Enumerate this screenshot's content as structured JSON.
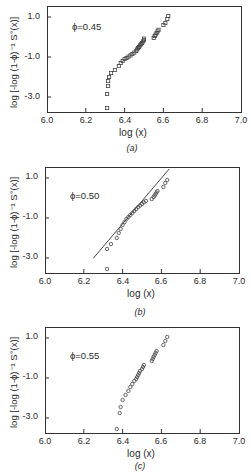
{
  "figure": {
    "panels": [
      {
        "id": "a",
        "phi_label": "ϕ=0.45",
        "caption": "(a)"
      },
      {
        "id": "b",
        "phi_label": "ϕ=0.50",
        "caption": "(b)"
      },
      {
        "id": "c",
        "phi_label": "ϕ=0.55",
        "caption": "(c)"
      }
    ],
    "ylabel": "log [-log (1-ϕ)⁻¹ S°(x)]",
    "xlabel": "log (x)",
    "xticks": [
      "6.0",
      "6.2",
      "6.4",
      "6.6",
      "6.8",
      "7.0"
    ],
    "yticks": [
      "1.0",
      "-1.0",
      "-3.0"
    ]
  },
  "chart_data": [
    {
      "type": "scatter",
      "title": "ϕ=0.45",
      "caption": "(a)",
      "xlabel": "log (x)",
      "ylabel": "log [-log (1-ϕ)^-1 S°(x)]",
      "xlim": [
        6.0,
        7.0
      ],
      "ylim": [
        -3.75,
        1.55
      ],
      "xticks": [
        6.0,
        6.2,
        6.4,
        6.6,
        6.8,
        7.0
      ],
      "yticks": [
        1.0,
        -1.0,
        -3.0
      ],
      "grid": false,
      "marker": "open-square",
      "series": [
        {
          "name": "ϕ=0.45",
          "x": [
            6.31,
            6.31,
            6.315,
            6.315,
            6.32,
            6.33,
            6.35,
            6.37,
            6.38,
            6.39,
            6.4,
            6.41,
            6.42,
            6.43,
            6.44,
            6.45,
            6.46,
            6.465,
            6.47,
            6.475,
            6.48,
            6.485,
            6.49,
            6.495,
            6.5,
            6.5,
            6.55,
            6.555,
            6.56,
            6.565,
            6.57,
            6.575,
            6.6,
            6.61,
            6.62,
            6.625
          ],
          "y": [
            -3.55,
            -2.85,
            -2.45,
            -2.2,
            -2.0,
            -1.8,
            -1.65,
            -1.45,
            -1.3,
            -1.2,
            -1.1,
            -1.05,
            -0.98,
            -0.92,
            -0.85,
            -0.78,
            -0.7,
            -0.62,
            -0.55,
            -0.5,
            -0.42,
            -0.36,
            -0.3,
            -0.22,
            -0.15,
            -0.08,
            -0.05,
            0.05,
            0.12,
            0.2,
            0.28,
            0.36,
            0.6,
            0.7,
            0.9,
            1.05
          ]
        }
      ]
    },
    {
      "type": "scatter",
      "title": "ϕ=0.50",
      "caption": "(b)",
      "xlabel": "log (x)",
      "ylabel": "log [-log (1-ϕ)^-1 S°(x)]",
      "xlim": [
        6.0,
        7.0
      ],
      "ylim": [
        -3.75,
        1.55
      ],
      "xticks": [
        6.0,
        6.2,
        6.4,
        6.6,
        6.8,
        7.0
      ],
      "yticks": [
        1.0,
        -1.0,
        -3.0
      ],
      "grid": false,
      "marker": "open-circle",
      "fit_line": {
        "x": [
          6.25,
          6.64
        ],
        "y": [
          -3.0,
          1.45
        ]
      },
      "series": [
        {
          "name": "ϕ=0.50",
          "x": [
            6.32,
            6.32,
            6.34,
            6.37,
            6.38,
            6.39,
            6.4,
            6.41,
            6.42,
            6.43,
            6.44,
            6.45,
            6.46,
            6.47,
            6.48,
            6.49,
            6.5,
            6.51,
            6.52,
            6.55,
            6.56,
            6.565,
            6.57,
            6.575,
            6.58,
            6.61,
            6.62,
            6.63
          ],
          "y": [
            -3.55,
            -2.55,
            -2.3,
            -2.0,
            -1.75,
            -1.55,
            -1.35,
            -1.2,
            -1.05,
            -0.95,
            -0.85,
            -0.75,
            -0.65,
            -0.55,
            -0.45,
            -0.38,
            -0.3,
            -0.22,
            -0.15,
            -0.05,
            0.05,
            0.12,
            0.2,
            0.28,
            0.35,
            0.55,
            0.75,
            0.9
          ]
        }
      ]
    },
    {
      "type": "scatter",
      "title": "ϕ=0.55",
      "caption": "(c)",
      "xlabel": "log (x)",
      "ylabel": "log [-log (1-ϕ)^-1 S°(x)]",
      "xlim": [
        6.0,
        7.0
      ],
      "ylim": [
        -3.75,
        1.55
      ],
      "xticks": [
        6.0,
        6.2,
        6.4,
        6.6,
        6.8,
        7.0
      ],
      "yticks": [
        1.0,
        -1.0,
        -3.0
      ],
      "grid": false,
      "marker": "open-circle",
      "series": [
        {
          "name": "ϕ=0.55",
          "x": [
            6.37,
            6.385,
            6.39,
            6.4,
            6.415,
            6.43,
            6.44,
            6.45,
            6.46,
            6.47,
            6.475,
            6.48,
            6.485,
            6.49,
            6.5,
            6.505,
            6.51,
            6.55,
            6.555,
            6.56,
            6.565,
            6.57,
            6.575,
            6.61,
            6.62,
            6.63
          ],
          "y": [
            -3.55,
            -2.75,
            -2.45,
            -2.1,
            -1.85,
            -1.65,
            -1.45,
            -1.3,
            -1.15,
            -1.05,
            -0.95,
            -0.85,
            -0.75,
            -0.65,
            -0.55,
            -0.45,
            -0.35,
            -0.15,
            -0.05,
            0.05,
            0.15,
            0.25,
            0.35,
            0.65,
            0.85,
            1.05
          ]
        }
      ]
    }
  ]
}
